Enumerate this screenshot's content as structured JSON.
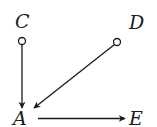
{
  "diagram": {
    "type": "directed-graph",
    "nodes": [
      {
        "id": "C",
        "label": "C",
        "marker": "open-circle"
      },
      {
        "id": "D",
        "label": "D",
        "marker": "open-circle"
      },
      {
        "id": "A",
        "label": "A",
        "marker": "none"
      },
      {
        "id": "E",
        "label": "E",
        "marker": "none"
      }
    ],
    "edges": [
      {
        "from": "C",
        "to": "A",
        "style": "arrow"
      },
      {
        "from": "D",
        "to": "A",
        "style": "arrow"
      },
      {
        "from": "A",
        "to": "E",
        "style": "arrow"
      }
    ],
    "colors": {
      "stroke": "#1a1a1a",
      "background": "#ffffff"
    }
  }
}
